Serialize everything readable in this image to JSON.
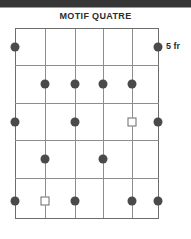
{
  "page": {
    "background_color": "#ffffff",
    "top_bar_color": "#363636"
  },
  "header": {
    "title": "MOTIF QUATRE"
  },
  "annotations": {
    "row_label": "5 fr"
  },
  "legend": {
    "filled_circle_icon": "filled-circle-marker",
    "open_square_icon": "open-square-marker"
  },
  "chart_data": {
    "type": "scatter",
    "title": "MOTIF QUATRE",
    "subtitle": "",
    "xlabel": "",
    "ylabel": "",
    "grid": true,
    "legend_position": "none",
    "annotations": [
      {
        "text": "5 fr",
        "x": 6.0,
        "y": 1,
        "placement": "right-of-row-1"
      }
    ],
    "axis_x_range": [
      0,
      5
    ],
    "axis_y_range": [
      1,
      6
    ],
    "x_gridlines": [
      0,
      1,
      2,
      3,
      4,
      5
    ],
    "y_gridlines": [
      1,
      2,
      3,
      4,
      5,
      6
    ],
    "columns": 5,
    "rows": 5,
    "marker_colors": {
      "filled-circle": "#4a4a4a",
      "open-square": "#ffffff",
      "open-square-stroke": "#6b6b6b",
      "gridline": "#8d8d8d",
      "border": "#6d6d6d"
    },
    "series": [
      {
        "name": "filled-circle",
        "marker": "filled-circle",
        "points": [
          {
            "x": 0,
            "y": 1,
            "px": 0,
            "py": 19
          },
          {
            "x": 5,
            "y": 1,
            "px": 143,
            "py": 19
          },
          {
            "x": 1.03,
            "y": 2,
            "px": 30,
            "py": 56
          },
          {
            "x": 2.08,
            "y": 2,
            "px": 60,
            "py": 56
          },
          {
            "x": 3.06,
            "y": 2,
            "px": 88,
            "py": 56
          },
          {
            "x": 4.08,
            "y": 2,
            "px": 117,
            "py": 56
          },
          {
            "x": 0,
            "y": 3,
            "px": 0,
            "py": 94
          },
          {
            "x": 2.08,
            "y": 3,
            "px": 60,
            "py": 94
          },
          {
            "x": 5,
            "y": 3,
            "px": 143,
            "py": 94
          },
          {
            "x": 1.03,
            "y": 4,
            "px": 30,
            "py": 131
          },
          {
            "x": 3.06,
            "y": 4,
            "px": 88,
            "py": 131
          },
          {
            "x": 0,
            "y": 5,
            "px": 0,
            "py": 173
          },
          {
            "x": 2.08,
            "y": 5,
            "px": 60,
            "py": 173
          },
          {
            "x": 4.08,
            "y": 5,
            "px": 117,
            "py": 173
          },
          {
            "x": 5,
            "y": 5,
            "px": 143,
            "py": 173
          }
        ]
      },
      {
        "name": "open-square",
        "marker": "open-square",
        "points": [
          {
            "x": 4.08,
            "y": 3,
            "px": 117,
            "py": 94
          },
          {
            "x": 1.03,
            "y": 5,
            "px": 30,
            "py": 173
          }
        ]
      }
    ],
    "vertical_lines_px": [
      0,
      30,
      60,
      88,
      117,
      143
    ],
    "horizontal_lines_px": [
      0,
      37,
      75,
      112,
      150,
      190
    ]
  }
}
